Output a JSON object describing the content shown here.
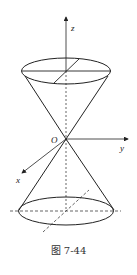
{
  "figure": {
    "caption": "图 7-44",
    "axes": {
      "z_label": "z",
      "y_label": "y",
      "x_label": "x",
      "origin_label": "O"
    },
    "stroke_color": "#222222",
    "background": "#ffffff"
  }
}
